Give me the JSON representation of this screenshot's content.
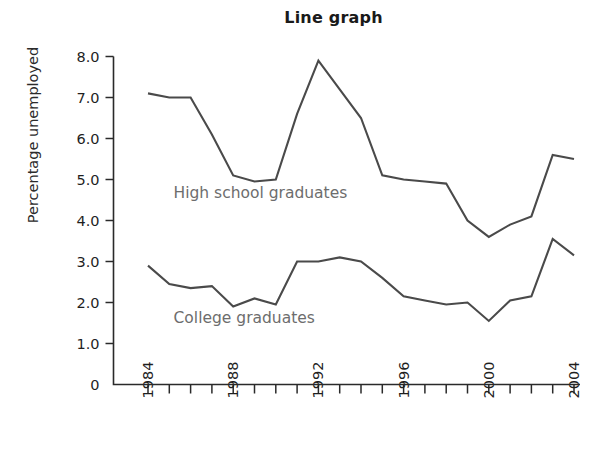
{
  "chart_data": {
    "type": "line",
    "title": "Line graph",
    "xlabel": "",
    "ylabel": "Percentage unemployed",
    "xlim": [
      1984,
      2004
    ],
    "ylim": [
      0,
      8.0
    ],
    "grid": false,
    "legend_position": "inline-annotation",
    "x": [
      1984,
      1985,
      1986,
      1987,
      1988,
      1989,
      1990,
      1991,
      1992,
      1993,
      1994,
      1995,
      1996,
      1997,
      1998,
      1999,
      2000,
      2001,
      2002,
      2003,
      2004
    ],
    "y_tick_labels": [
      "0",
      "1.0",
      "2.0",
      "3.0",
      "4.0",
      "5.0",
      "6.0",
      "7.0",
      "8.0"
    ],
    "y_tick_values": [
      0,
      1.0,
      2.0,
      3.0,
      4.0,
      5.0,
      6.0,
      7.0,
      8.0
    ],
    "x_tick_labels": [
      "1984",
      "1988",
      "1992",
      "1996",
      "2000",
      "2004"
    ],
    "x_tick_values": [
      1984,
      1988,
      1992,
      1996,
      2000,
      2004
    ],
    "series": [
      {
        "name": "High school graduates",
        "label_x": 1985.2,
        "label_y": 4.55,
        "values": [
          7.1,
          7.0,
          7.0,
          6.1,
          5.1,
          4.95,
          5.0,
          6.6,
          7.9,
          7.2,
          6.5,
          5.1,
          5.0,
          4.95,
          4.9,
          4.0,
          3.6,
          3.9,
          4.1,
          5.6,
          5.5
        ]
      },
      {
        "name": "College graduates",
        "label_x": 1985.2,
        "label_y": 1.5,
        "values": [
          2.9,
          2.45,
          2.35,
          2.4,
          1.9,
          2.1,
          1.95,
          3.0,
          3.0,
          3.1,
          3.0,
          2.6,
          2.15,
          2.05,
          1.95,
          2.0,
          1.55,
          2.05,
          2.15,
          3.55,
          3.15
        ]
      }
    ]
  },
  "colors": {
    "line": "#4a4a4a",
    "axis": "#2a2a2a",
    "title": "#1a1a1a",
    "annotation": "#6d6d6d",
    "background": "#ffffff"
  }
}
